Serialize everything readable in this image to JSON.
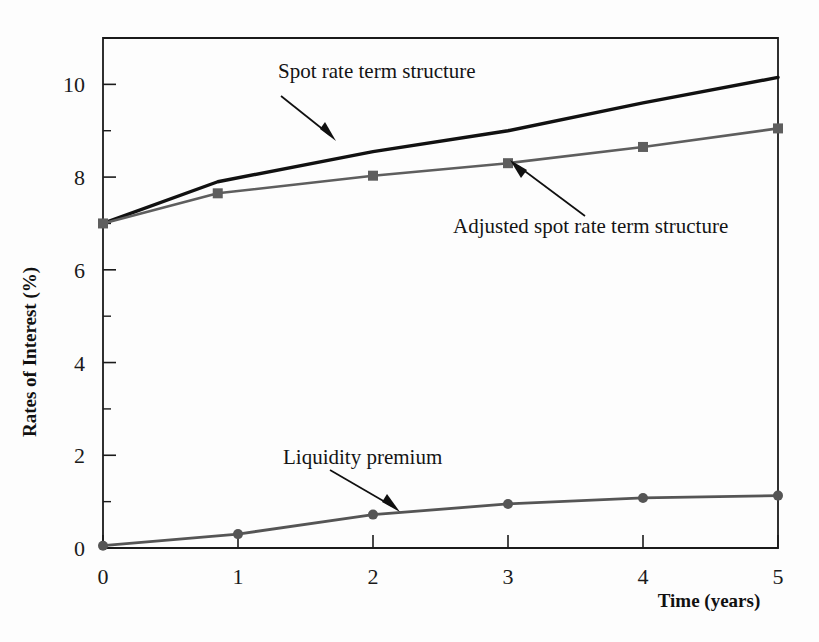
{
  "figure": {
    "background": "#fdfdfd",
    "plot_area": {
      "left": 103,
      "top": 38,
      "right": 778,
      "bottom": 548
    }
  },
  "axes": {
    "x_title": "Time (years)",
    "y_title": "Rates of Interest (%)",
    "x_ticks": [
      "0",
      "1",
      "2",
      "3",
      "4",
      "5"
    ],
    "y_ticks": [
      "0",
      "2",
      "4",
      "6",
      "8",
      "10"
    ]
  },
  "annotations": [
    {
      "id": "spot",
      "text": "Spot rate term structure"
    },
    {
      "id": "adjusted",
      "text": "Adjusted spot rate term structure"
    },
    {
      "id": "premium",
      "text": "Liquidity premium"
    }
  ],
  "colors": {
    "spot": "#111111",
    "adjusted": "#5e5e5e",
    "premium": "#555555",
    "axis": "#1b1b1b",
    "text": "#141414"
  },
  "chart_data": {
    "type": "line",
    "title": "",
    "xlabel": "Time (years)",
    "ylabel": "Rates of Interest (%)",
    "xlim": [
      0,
      5
    ],
    "ylim": [
      0,
      11
    ],
    "grid": false,
    "legend": "annotations-with-arrows",
    "x_tick_values": [
      0,
      1,
      2,
      3,
      4,
      5
    ],
    "y_tick_values": [
      0,
      2,
      4,
      6,
      8,
      10
    ],
    "y_minor_tick_values": [
      1,
      3,
      5,
      7,
      9,
      11
    ],
    "series": [
      {
        "name": "Spot rate term structure",
        "color": "#111111",
        "marker": "none",
        "x": [
          0,
          0.85,
          2,
          3,
          4,
          5
        ],
        "values": [
          7.0,
          7.9,
          8.55,
          9.0,
          9.6,
          10.15
        ]
      },
      {
        "name": "Adjusted spot rate term structure",
        "color": "#5e5e5e",
        "marker": "square",
        "x": [
          0,
          0.85,
          2,
          3,
          4,
          5
        ],
        "values": [
          7.0,
          7.65,
          8.03,
          8.3,
          8.65,
          9.05
        ]
      },
      {
        "name": "Liquidity premium",
        "color": "#555555",
        "marker": "circle",
        "x": [
          0,
          1,
          2,
          3,
          4,
          5
        ],
        "values": [
          0.05,
          0.3,
          0.72,
          0.95,
          1.08,
          1.13
        ]
      }
    ]
  }
}
